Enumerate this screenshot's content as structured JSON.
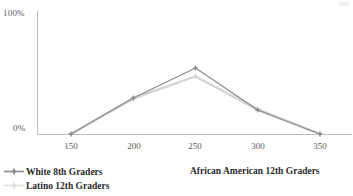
{
  "chart_data": {
    "type": "line",
    "title": "",
    "xlabel": "",
    "ylabel": "",
    "x": [
      150,
      200,
      250,
      300,
      350
    ],
    "categories": [
      "150",
      "200",
      "250",
      "300",
      "350"
    ],
    "xlim": [
      150,
      350
    ],
    "ylim": [
      0,
      100
    ],
    "ytick_labels": [
      "0%",
      "100%"
    ],
    "ytick_values": [
      0,
      100
    ],
    "grid": false,
    "legend_position": "bottom-left",
    "series": [
      {
        "name": "White 8th Graders",
        "color": "#8c8c8c",
        "marker": "star",
        "values": [
          0,
          30,
          55,
          20,
          0
        ]
      },
      {
        "name": "Latino 12th Graders",
        "color": "#d8d8d8",
        "marker": "star",
        "values": [
          0,
          29,
          48,
          21,
          0
        ]
      },
      {
        "name": "African American 12th Graders",
        "color": "#c8c8c8",
        "marker": "star",
        "values": [
          0,
          30,
          48,
          20,
          0
        ]
      }
    ]
  },
  "axes": {
    "y_top_label": "100%",
    "y_bottom_label": "0%",
    "x_tick_labels": [
      "150",
      "200",
      "250",
      "300",
      "350"
    ],
    "axis_color": "#bfbfbf"
  },
  "legend": {
    "entries": [
      {
        "label": "White 8th Graders",
        "color": "#8c8c8c"
      },
      {
        "label": "Latino 12th Graders",
        "color": "#dcdcdc"
      }
    ],
    "side_entry": {
      "label": "African American 12th Graders",
      "color": "#c8c8c8"
    }
  }
}
